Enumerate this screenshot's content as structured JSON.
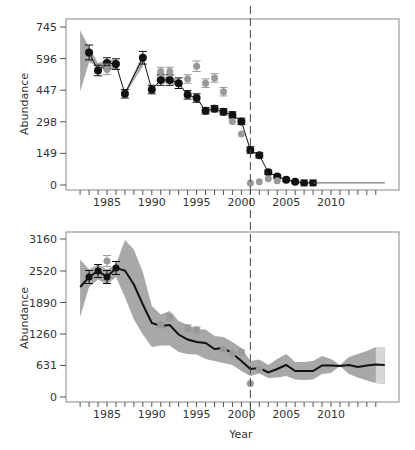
{
  "chart_data": [
    {
      "type": "line",
      "panel": "top",
      "title": "",
      "xlabel": "",
      "ylabel": "Abundance",
      "xlim": [
        1981,
        2016
      ],
      "ylim": [
        0,
        745
      ],
      "yticks": [
        0,
        149,
        298,
        447,
        596,
        745
      ],
      "xticks": [
        1985,
        1990,
        1995,
        2000,
        2005,
        2010
      ],
      "grid": false,
      "vertical_reference_line": 2001,
      "series": [
        {
          "name": "Model estimate (black, with error bars)",
          "color": "#111111",
          "marker": "circle",
          "x": [
            1983,
            1984,
            1985,
            1986,
            1987,
            1989,
            1990,
            1991,
            1992,
            1993,
            1994,
            1995,
            1996,
            1997,
            1998,
            1999,
            2000,
            2001,
            2002,
            2003,
            2004,
            2005,
            2006,
            2007,
            2008
          ],
          "values": [
            625,
            540,
            575,
            570,
            430,
            600,
            450,
            495,
            495,
            480,
            425,
            410,
            350,
            360,
            345,
            330,
            300,
            165,
            140,
            60,
            40,
            25,
            15,
            10,
            10
          ],
          "err": [
            35,
            25,
            25,
            25,
            20,
            30,
            20,
            25,
            25,
            25,
            20,
            20,
            15,
            15,
            15,
            15,
            15,
            15,
            12,
            10,
            8,
            6,
            5,
            4,
            4
          ]
        },
        {
          "name": "Observed (gray, with error bars)",
          "color": "#999999",
          "marker": "circle",
          "x": [
            1985,
            1991,
            1992,
            1994,
            1995,
            1996,
            1997,
            1998,
            1999,
            2000,
            2001,
            2002,
            2003,
            2004
          ],
          "values": [
            545,
            535,
            535,
            500,
            560,
            480,
            505,
            440,
            300,
            240,
            10,
            15,
            30,
            20
          ],
          "err": [
            25,
            20,
            20,
            20,
            25,
            20,
            20,
            20,
            0,
            0,
            0,
            0,
            0,
            0
          ]
        },
        {
          "name": "Projection (flat line)",
          "color": "#555555",
          "x": [
            2008,
            2016
          ],
          "values": [
            10,
            10
          ]
        }
      ],
      "bands": [
        {
          "x": [
            1982,
            1983,
            1984,
            1985,
            1986
          ],
          "lower": [
            440,
            580,
            555,
            540,
            545
          ],
          "upper": [
            730,
            650,
            575,
            590,
            590
          ]
        },
        {
          "x": [
            1987,
            1989
          ],
          "lower": [
            425,
            560
          ],
          "upper": [
            440,
            615
          ]
        },
        {
          "x": [
            1991,
            1992,
            1993
          ],
          "lower": [
            480,
            480,
            465
          ],
          "upper": [
            510,
            510,
            495
          ]
        }
      ]
    },
    {
      "type": "area",
      "panel": "bottom",
      "title": "",
      "xlabel": "Year",
      "ylabel": "Abundance",
      "xlim": [
        1981,
        2016
      ],
      "ylim": [
        0,
        3160
      ],
      "yticks": [
        0,
        631,
        1260,
        1890,
        2520,
        3160
      ],
      "xticks": [
        1985,
        1990,
        1995,
        2000,
        2005,
        2010
      ],
      "grid": false,
      "vertical_reference_line": 2001,
      "series": [
        {
          "name": "Model estimate (black line)",
          "color": "#111111",
          "x": [
            1982,
            1983,
            1984,
            1985,
            1986,
            1987,
            1988,
            1989,
            1990,
            1991,
            1992,
            1993,
            1994,
            1995,
            1996,
            1997,
            1998,
            1999,
            2000,
            2001,
            2002,
            2003,
            2004,
            2005,
            2006,
            2007,
            2008,
            2009,
            2010,
            2011,
            2012,
            2013,
            2014,
            2015,
            2016
          ],
          "values": [
            2200,
            2400,
            2520,
            2400,
            2580,
            2530,
            2250,
            1850,
            1480,
            1420,
            1440,
            1250,
            1150,
            1100,
            1080,
            960,
            980,
            870,
            720,
            560,
            580,
            490,
            560,
            640,
            520,
            520,
            520,
            630,
            630,
            620,
            640,
            600,
            630,
            650,
            640
          ]
        },
        {
          "name": "Observed points (black, with error bars)",
          "color": "#111111",
          "marker": "circle",
          "x": [
            1983,
            1984,
            1985,
            1986
          ],
          "values": [
            2400,
            2520,
            2400,
            2580
          ],
          "err": [
            130,
            130,
            130,
            130
          ]
        },
        {
          "name": "Observed points (gray)",
          "color": "#999999",
          "marker": "circle",
          "x": [
            1985,
            1991,
            1992,
            1994,
            1995,
            1998,
            1999,
            2000,
            2001,
            2002
          ],
          "values": [
            2720,
            1440,
            1590,
            1380,
            1340,
            950,
            870,
            900,
            270,
            560
          ],
          "err": [
            110,
            60,
            60,
            60,
            60,
            0,
            0,
            0,
            0,
            0
          ]
        }
      ],
      "band": {
        "x": [
          1982,
          1983,
          1984,
          1985,
          1986,
          1987,
          1988,
          1989,
          1990,
          1991,
          1992,
          1993,
          1994,
          1995,
          1996,
          1997,
          1998,
          1999,
          2000,
          2001,
          2002,
          2003,
          2004,
          2005,
          2006,
          2007,
          2008,
          2009,
          2010,
          2011,
          2012,
          2013,
          2014,
          2015,
          2016
        ],
        "lower": [
          1600,
          2200,
          2350,
          2250,
          2400,
          2000,
          1550,
          1250,
          1000,
          1030,
          1030,
          900,
          860,
          850,
          760,
          720,
          680,
          640,
          520,
          420,
          470,
          380,
          390,
          420,
          350,
          340,
          350,
          460,
          480,
          620,
          460,
          390,
          330,
          280,
          260
        ],
        "upper": [
          2750,
          2550,
          2650,
          2550,
          2650,
          3140,
          2950,
          2500,
          1820,
          1650,
          1720,
          1520,
          1440,
          1360,
          1350,
          1220,
          1200,
          1100,
          980,
          720,
          750,
          640,
          760,
          860,
          700,
          700,
          720,
          820,
          760,
          640,
          800,
          860,
          920,
          1000,
          1000
        ]
      },
      "band_light_segment": {
        "x": [
          2015,
          2016
        ]
      }
    }
  ],
  "labels": {
    "top_ylabel": "Abundance",
    "bottom_ylabel": "Abundance",
    "bottom_xlabel": "Year",
    "top_yticks": [
      "745",
      "596",
      "447",
      "298",
      "149",
      "0"
    ],
    "bottom_yticks": [
      "3160",
      "2520",
      "1890",
      "1260",
      "631",
      "0"
    ],
    "xticks": [
      "1985",
      "1990",
      "1995",
      "2000",
      "2005",
      "2010"
    ]
  }
}
